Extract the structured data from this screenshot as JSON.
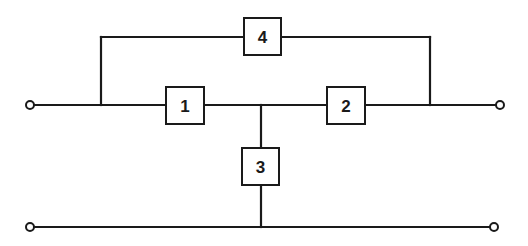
{
  "diagram": {
    "type": "two-port network block diagram",
    "colors": {
      "stroke": "#1a1a1a",
      "background": "#ffffff"
    },
    "blocks": [
      {
        "id": "1",
        "label": "1"
      },
      {
        "id": "2",
        "label": "2"
      },
      {
        "id": "3",
        "label": "3"
      },
      {
        "id": "4",
        "label": "4"
      }
    ],
    "terminals": [
      "input-top",
      "output-top",
      "input-bottom",
      "output-bottom"
    ],
    "connections": [
      "input-top -> block 1 -> junction -> block 2 -> output-top",
      "junction -> block 3 -> bottom rail",
      "input-top node -> block 4 -> output-top node (bypass over 1 and 2)",
      "input-bottom -> bottom rail -> output-bottom"
    ]
  }
}
